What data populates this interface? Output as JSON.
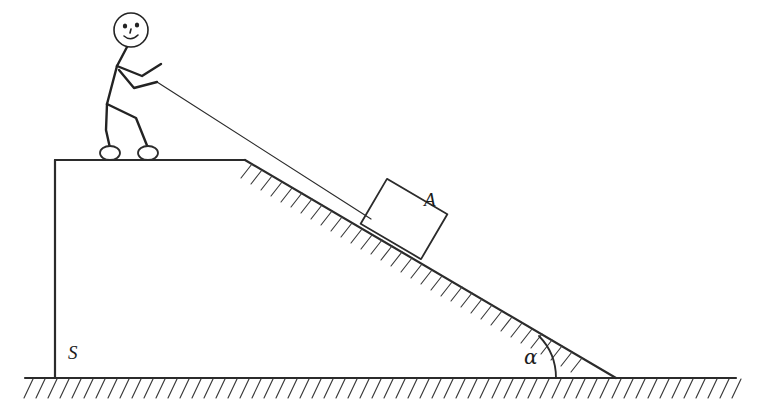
{
  "diagram": {
    "labels": {
      "block": "A",
      "height": "S",
      "angle": "α"
    },
    "icons": {
      "person": "stick-figure-icon",
      "block": "block-icon",
      "rope": "rope-icon",
      "incline": "incline-icon",
      "ground": "ground-icon",
      "angle_arc": "angle-arc-icon"
    },
    "colors": {
      "stroke": "#2b2b2b",
      "body_stroke": "#232323",
      "hatch": "#3a3a3a",
      "background": "#ffffff",
      "label_text": "#1c1c1c"
    },
    "geometry": {
      "ground_y": 378,
      "ground_x_start": 25,
      "ground_x_end": 736,
      "wall_x": 55,
      "platform_top_y": 160,
      "platform_top_x_end": 245,
      "incline_top": [
        245,
        160
      ],
      "incline_bottom": [
        616,
        378
      ],
      "rope_start": [
        157,
        82
      ],
      "rope_end": [
        371,
        219
      ]
    }
  }
}
